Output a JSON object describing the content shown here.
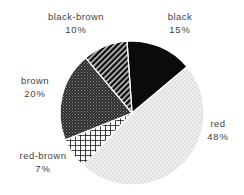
{
  "chart_data": {
    "type": "pie",
    "title": "",
    "categories": [
      "black",
      "red",
      "red-brown",
      "brown",
      "black-brown"
    ],
    "values": [
      15,
      48,
      7,
      20,
      10
    ],
    "value_unit": "%",
    "legend": "none",
    "labels_position": "outside",
    "slices": [
      {
        "label": "black",
        "value": 15,
        "value_text": "15%",
        "pattern": "solid-black",
        "color": "#0b0b0b"
      },
      {
        "label": "red",
        "value": 48,
        "value_text": "48%",
        "pattern": "light-dots",
        "color": "#e8e8e8"
      },
      {
        "label": "red-brown",
        "value": 7,
        "value_text": "7%",
        "pattern": "crosshatch",
        "color": "#f2f2f2"
      },
      {
        "label": "brown",
        "value": 20,
        "value_text": "20%",
        "pattern": "dense-stipple",
        "color": "#3b3b3b"
      },
      {
        "label": "black-brown",
        "value": 10,
        "value_text": "10%",
        "pattern": "diagonal-hatch",
        "color": "#1a1a1a"
      }
    ]
  },
  "labels": {
    "black": {
      "name": "black",
      "pct": "15%"
    },
    "red": {
      "name": "red",
      "pct": "48%"
    },
    "red_brown": {
      "name": "red-brown",
      "pct": "7%"
    },
    "brown": {
      "name": "brown",
      "pct": "20%"
    },
    "black_brown": {
      "name": "black-brown",
      "pct": "10%"
    }
  },
  "colors": {
    "background": "#ffffff",
    "text": "#3f3f3f",
    "slice_outline": "#ffffff"
  }
}
